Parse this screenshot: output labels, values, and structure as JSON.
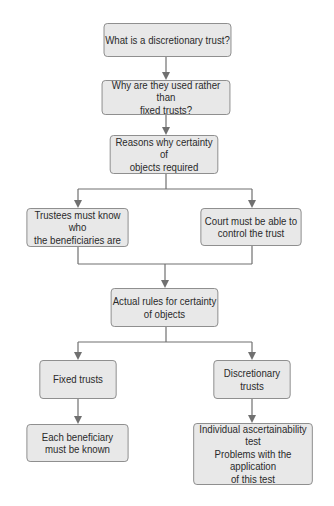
{
  "diagram": {
    "type": "flowchart",
    "colors": {
      "box_fill": "#e8e8e8",
      "box_border": "#8a8a8a",
      "line": "#707070",
      "text": "#2a2a2a"
    },
    "nodes": [
      {
        "id": "n1",
        "lines": [
          "What is a discretionary trust?"
        ]
      },
      {
        "id": "n2",
        "lines": [
          "Why are they used rather than",
          "fixed trusts?"
        ]
      },
      {
        "id": "n3",
        "lines": [
          "Reasons why certainty of",
          "objects required"
        ]
      },
      {
        "id": "n4",
        "lines": [
          "Trustees must know who",
          "the beneficiaries are"
        ]
      },
      {
        "id": "n5",
        "lines": [
          "Court must be able to",
          "control the trust"
        ]
      },
      {
        "id": "n6",
        "lines": [
          "Actual rules for certainty",
          "of objects"
        ]
      },
      {
        "id": "n7",
        "lines": [
          "Fixed trusts"
        ]
      },
      {
        "id": "n8",
        "lines": [
          "Discretionary",
          "trusts"
        ]
      },
      {
        "id": "n9",
        "lines": [
          "Each beneficiary",
          "must be known"
        ]
      },
      {
        "id": "n10",
        "lines": [
          "Individual ascertainability test",
          "Problems with the application",
          "of this test"
        ]
      }
    ],
    "edges": [
      [
        "n1",
        "n2"
      ],
      [
        "n2",
        "n3"
      ],
      [
        "n3",
        "n4"
      ],
      [
        "n3",
        "n5"
      ],
      [
        "n4",
        "n6"
      ],
      [
        "n5",
        "n6"
      ],
      [
        "n6",
        "n7"
      ],
      [
        "n6",
        "n8"
      ],
      [
        "n7",
        "n9"
      ],
      [
        "n8",
        "n10"
      ]
    ]
  }
}
